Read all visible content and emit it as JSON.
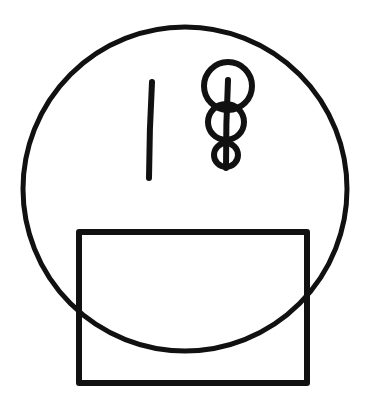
{
  "canvas": {
    "width": 374,
    "height": 407,
    "background_color": "#ffffff",
    "ink_color": "#111111"
  },
  "figure": {
    "title": "",
    "description": "Hand-drawn line figure: a large circle overlapping a rectangle, with a short vertical stroke and a stack of three decreasing circles pierced by a vertical line inside the upper part of the circle.",
    "style": "monochrome black ink line drawing on white, no fill",
    "shapes": [
      {
        "name": "large-circle",
        "type": "circle",
        "center_x": 185,
        "center_y": 189,
        "radius": 162,
        "stroke_width": 5,
        "stroke_color": "#111111",
        "fill": "none"
      },
      {
        "name": "rectangle",
        "type": "rect",
        "x": 79,
        "y": 232,
        "width": 228,
        "height": 151,
        "stroke_width": 6,
        "stroke_color": "#111111",
        "fill": "none"
      },
      {
        "name": "vertical-tick-stroke",
        "type": "line",
        "x1": 152,
        "y1": 82,
        "x2": 149,
        "y2": 178,
        "stroke_width": 6,
        "stroke_color": "#111111"
      },
      {
        "name": "stack-axis-line",
        "type": "line",
        "x1": 228,
        "y1": 80,
        "x2": 226,
        "y2": 168,
        "stroke_width": 6,
        "stroke_color": "#111111"
      },
      {
        "name": "stack-circle-top",
        "type": "circle",
        "center_x": 228,
        "center_y": 86,
        "radius": 24,
        "stroke_width": 6,
        "stroke_color": "#111111",
        "fill": "none"
      },
      {
        "name": "stack-circle-middle",
        "type": "circle",
        "center_x": 226,
        "center_y": 122,
        "radius": 18,
        "stroke_width": 6,
        "stroke_color": "#111111",
        "fill": "none"
      },
      {
        "name": "stack-circle-bottom",
        "type": "circle",
        "center_x": 226,
        "center_y": 155,
        "radius": 12,
        "stroke_width": 6,
        "stroke_color": "#111111",
        "fill": "none"
      }
    ]
  }
}
